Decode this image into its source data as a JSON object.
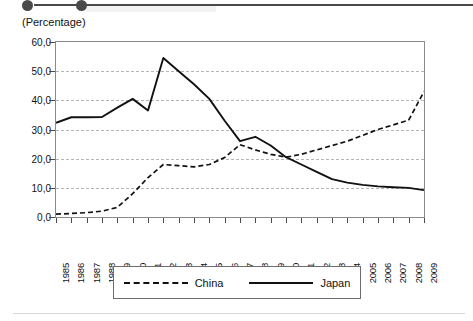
{
  "decor": {
    "top_bar_name": "cut-off-header-rule",
    "bottom_rule_name": "footer-hairline"
  },
  "chart_data": {
    "type": "line",
    "title": "",
    "subtitle": "",
    "ylabel": "(Percentage)",
    "xlabel": "",
    "ylim": [
      0,
      60
    ],
    "ytick_step": 10,
    "ytick_labels": [
      "0,0",
      "10,0",
      "20,0",
      "30,0",
      "40,0",
      "50,0",
      "60,0"
    ],
    "ytick_values": [
      0,
      10,
      20,
      30,
      40,
      50,
      60
    ],
    "grid": true,
    "grid_axis": "y",
    "grid_style": "dashed",
    "legend_position": "bottom-center",
    "x": [
      1985,
      1986,
      1987,
      1988,
      1989,
      1990,
      1991,
      1992,
      1993,
      1994,
      1995,
      1996,
      1997,
      1998,
      1999,
      2000,
      2001,
      2002,
      2003,
      2004,
      2005,
      2006,
      2007,
      2008,
      2009
    ],
    "categories": [
      "1985",
      "1986",
      "1987",
      "1988",
      "1989",
      "1990",
      "1991",
      "1992",
      "1993",
      "1994",
      "1995",
      "1996",
      "1997",
      "1998",
      "1999",
      "2000",
      "2001",
      "2002",
      "2003",
      "2004",
      "2005",
      "2006",
      "2007",
      "2008",
      "2009"
    ],
    "series": [
      {
        "name": "China",
        "style": "dashed",
        "color": "#111111",
        "values": [
          1.0,
          1.2,
          1.5,
          2.0,
          3.3,
          8.0,
          13.5,
          18.0,
          17.6,
          17.2,
          18.0,
          20.4,
          24.8,
          23.0,
          21.5,
          20.5,
          21.5,
          23.0,
          24.5,
          26.0,
          28.0,
          30.0,
          31.6,
          33.2,
          43.0
        ]
      },
      {
        "name": "Japan",
        "style": "solid",
        "color": "#111111",
        "values": [
          32.3,
          34.2,
          34.2,
          34.3,
          37.5,
          40.5,
          36.5,
          54.5,
          50.0,
          45.5,
          40.5,
          33.0,
          26.0,
          27.5,
          24.5,
          20.5,
          18.0,
          15.5,
          13.0,
          11.8,
          11.0,
          10.5,
          10.2,
          10.0,
          9.2
        ]
      }
    ]
  },
  "legend": {
    "items": [
      {
        "label": "China",
        "style": "dashed"
      },
      {
        "label": "Japan",
        "style": "solid"
      }
    ]
  }
}
